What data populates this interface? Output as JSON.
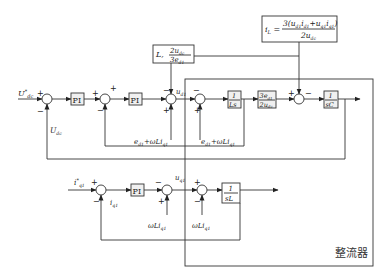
{
  "diagram": {
    "plant_label": "整流器",
    "formula_box": {
      "lhs": "i",
      "lhs_sub": "L",
      "numerator": "3(u",
      "num_parts": [
        "3(u",
        "d1",
        "i",
        "d1",
        "+u",
        "q1",
        "i",
        "q1",
        ")"
      ],
      "denominator": "2u",
      "den_sub": "dc"
    },
    "gain_box": {
      "prefix": "L,",
      "numerator": "2u",
      "num_sub": "dc",
      "denominator": "3e",
      "den_sub": "d1"
    },
    "row_d": {
      "input": {
        "label": "U",
        "sup": "*",
        "sub": "dc"
      },
      "feedback_label": {
        "label": "U",
        "sub": "dc"
      },
      "pi1": "PI",
      "pi2": "PI",
      "u_label": {
        "label": "u",
        "sub": "d1"
      },
      "ff1": {
        "text": "e",
        "sub": "d1",
        "rest": "+ωLi",
        "sub2": "q1"
      },
      "ff2": {
        "text": "e",
        "sub": "d1",
        "rest": "+ωLi",
        "sub2": "q1"
      },
      "block_1_over_Ls": {
        "num": "1",
        "den": "Ls"
      },
      "block_gain": {
        "num": "3e",
        "num_sub": "d1",
        "den": "2u",
        "den_sub": "dc"
      },
      "block_1_over_sC": {
        "num": "1",
        "den": "sC"
      }
    },
    "row_q": {
      "input": {
        "label": "i",
        "sup": "*",
        "sub": "q1"
      },
      "feedback_label": {
        "label": "i",
        "sub": "q1"
      },
      "pi": "PI",
      "u_label": {
        "label": "u",
        "sub": "q1"
      },
      "ff1": {
        "text": "ωLi",
        "sub": "q1"
      },
      "ff2": {
        "text": "ωLi",
        "sub": "q1"
      },
      "block_1_over_sL": {
        "num": "1",
        "den": "sL"
      }
    },
    "signs": {
      "plus": "+",
      "minus": "−"
    }
  }
}
